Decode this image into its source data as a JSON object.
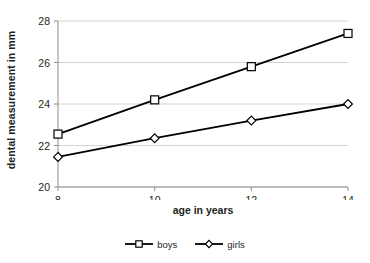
{
  "chart_data": {
    "type": "line",
    "title": "",
    "xlabel": "age in years",
    "ylabel": "dental measurement in mm",
    "categories": [
      8,
      10,
      12,
      14
    ],
    "xtick_labels": [
      "8",
      "10",
      "12",
      "14"
    ],
    "ytick_labels": [
      "20",
      "22",
      "24",
      "26",
      "28"
    ],
    "yticks": [
      20,
      22,
      24,
      26,
      28
    ],
    "ylim": [
      20,
      28
    ],
    "grid": "horizontal",
    "legend_position": "bottom-center",
    "series": [
      {
        "name": "boys",
        "marker": "square",
        "color": "#000000",
        "values": [
          22.55,
          24.2,
          25.8,
          27.4
        ]
      },
      {
        "name": "girls",
        "marker": "diamond",
        "color": "#000000",
        "values": [
          21.45,
          22.35,
          23.2,
          24.0
        ]
      }
    ]
  },
  "axes": {
    "y_title": "dental measurement in mm",
    "x_title": "age in years"
  },
  "legend": {
    "items": [
      {
        "label": "boys",
        "marker": "square"
      },
      {
        "label": "girls",
        "marker": "diamond"
      }
    ]
  },
  "colors": {
    "series": "#000000",
    "gridline": "#d4d4d4",
    "axis": "#8c8c8c",
    "text": "#231f20",
    "background": "#ffffff"
  }
}
